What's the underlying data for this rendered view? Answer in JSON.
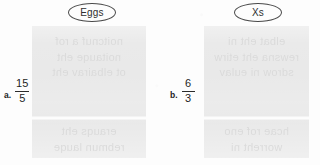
{
  "page": {
    "width": 320,
    "height": 165,
    "background_color": "#fdfdfd",
    "panel_color": "#e9e9e9",
    "ink_color": "#2a2a2a"
  },
  "columns": [
    {
      "heading": "Eggs",
      "problem": {
        "letter": "a.",
        "numerator": "15",
        "denominator": "5"
      },
      "ghost_text": {
        "top": [
          "noitcnuf a rof",
          "noitauqe eht",
          "ot elbairav eht"
        ],
        "bottom": [
          "erauqs eht",
          "rebmun lauqe"
        ]
      }
    },
    {
      "heading": "Xs",
      "problem": {
        "letter": "b.",
        "numerator": "6",
        "denominator": "3"
      },
      "ghost_text": {
        "top": [
          "elbat eht ni",
          "rewsna eht etirw",
          "sdrow ni eulav"
        ],
        "bottom": [
          "hcae rof eno",
          "worreht ni"
        ]
      }
    }
  ]
}
